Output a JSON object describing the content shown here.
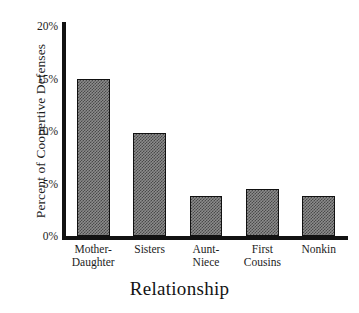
{
  "chart_data": {
    "type": "bar",
    "title": "",
    "subtitle": "",
    "xlabel": "Relationship",
    "ylabel": "Percent of Coopertive Defenses",
    "categories": [
      "Mother-Daughter",
      "Sisters",
      "Aunt-Niece",
      "First Cousins",
      "Nonkin"
    ],
    "category_lines": [
      [
        "Mother-",
        "Daughter"
      ],
      [
        "Sisters"
      ],
      [
        "Aunt-",
        "Niece"
      ],
      [
        "First",
        "Cousins"
      ],
      [
        "Nonkin"
      ]
    ],
    "values": [
      15.0,
      9.8,
      3.8,
      4.5,
      3.8
    ],
    "value_unit": "%",
    "ylim": [
      0,
      20
    ],
    "yticks": [
      0,
      5,
      10,
      15,
      20
    ],
    "ytick_labels": [
      "0%",
      "5%",
      "10%",
      "15%",
      "20%"
    ],
    "grid": false,
    "legend": false,
    "legend_position": "none",
    "bar_fill": "#8c8c8c",
    "bar_edge": "#111111",
    "axis_color": "#121212",
    "background": "#ffffff"
  },
  "axes": {
    "y_title": "Percent of Coopertive Defenses",
    "x_title": "Relationship"
  },
  "yticks": [
    {
      "label": "20%",
      "value": 20
    },
    {
      "label": "15%",
      "value": 15
    },
    {
      "label": "10%",
      "value": 10
    },
    {
      "label": "5%",
      "value": 5
    },
    {
      "label": "0%",
      "value": 0
    }
  ],
  "bars": [
    {
      "label_line1": "Mother-",
      "label_line2": "Daughter",
      "value": 15.0
    },
    {
      "label_line1": "Sisters",
      "label_line2": "",
      "value": 9.8
    },
    {
      "label_line1": "Aunt-",
      "label_line2": "Niece",
      "value": 3.8
    },
    {
      "label_line1": "First",
      "label_line2": "Cousins",
      "value": 4.5
    },
    {
      "label_line1": "Nonkin",
      "label_line2": "",
      "value": 3.8
    }
  ]
}
